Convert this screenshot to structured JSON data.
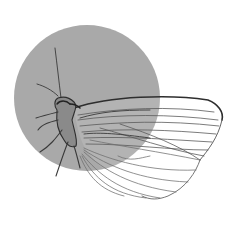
{
  "illustration": {
    "subject": "butterfly line drawing over gray circle",
    "caption": "Butterfly illustration",
    "colors": {
      "background": "#ffffff",
      "circle": "#a9a9a9",
      "ink": "#3a3a3a",
      "vein": "#6a6a6a"
    }
  }
}
